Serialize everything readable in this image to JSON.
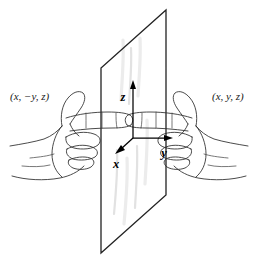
{
  "figure": {
    "name": "mirror-reflection-coordinate-diagram",
    "background_color": "#ffffff",
    "ink_color": "#2b2b2b",
    "plane_edge_color": "#232323",
    "glare_color": "#e2e2e2"
  },
  "labels": {
    "left_point": "(x, −y, z)",
    "right_point": "(x, y, z)"
  },
  "axes": {
    "origin": {
      "x": 133,
      "y": 138
    },
    "items": [
      {
        "name": "z",
        "label": "z",
        "direction": "up",
        "tip_x": 133,
        "tip_y": 82,
        "label_x": 124,
        "label_y": 100
      },
      {
        "name": "x",
        "label": "x",
        "direction": "down-left",
        "tip_x": 116,
        "tip_y": 152,
        "label_x": 115,
        "label_y": 167
      },
      {
        "name": "y",
        "label": "y",
        "direction": "right",
        "tip_x": 173,
        "tip_y": 138,
        "label_x": 163,
        "label_y": 156
      }
    ]
  },
  "plane": {
    "name": "mirror-plane",
    "corners": [
      {
        "x": 166,
        "y": 10
      },
      {
        "x": 166,
        "y": 195
      },
      {
        "x": 101,
        "y": 253
      },
      {
        "x": 101,
        "y": 68
      }
    ]
  },
  "hands": [
    {
      "name": "left-hand",
      "side": "left",
      "pointing": "right",
      "label": "(x, −y, z)"
    },
    {
      "name": "right-hand",
      "side": "right",
      "pointing": "left",
      "label": "(x, y, z)"
    }
  ]
}
